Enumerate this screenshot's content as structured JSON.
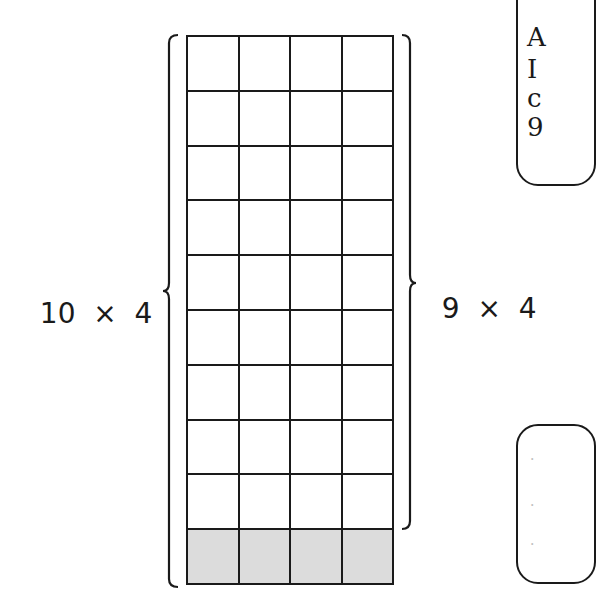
{
  "diagram": {
    "grid": {
      "rows": 10,
      "cols": 4,
      "shaded_rows": [
        9
      ],
      "shade_color": "#dcdcdc",
      "line_color": "#1a1a1a"
    },
    "left_label": {
      "a": "10",
      "op": "×",
      "b": "4",
      "text": "10 × 4",
      "spans_rows": 10
    },
    "right_label": {
      "a": "9",
      "op": "×",
      "b": "4",
      "text": "9 × 4",
      "spans_rows": 9
    },
    "callout_top": {
      "lines": [
        "A",
        "I",
        "c",
        "9"
      ]
    },
    "callout_bottom": {
      "lines": [
        "·",
        "·",
        "·"
      ]
    }
  }
}
